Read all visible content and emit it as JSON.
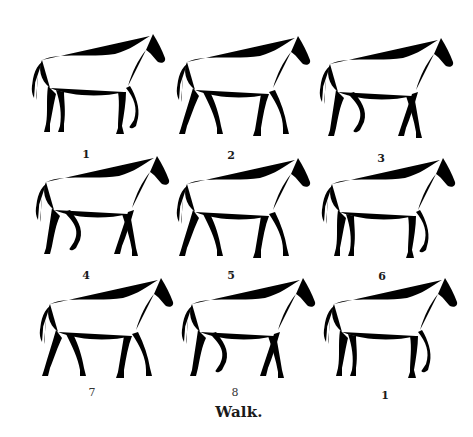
{
  "figure": {
    "caption": "Walk.",
    "panels": [
      {
        "label": "1",
        "row": 1,
        "col": 1
      },
      {
        "label": "2",
        "row": 1,
        "col": 2
      },
      {
        "label": "3",
        "row": 1,
        "col": 3
      },
      {
        "label": "4",
        "row": 2,
        "col": 1
      },
      {
        "label": "5",
        "row": 2,
        "col": 2
      },
      {
        "label": "6",
        "row": 2,
        "col": 3
      },
      {
        "label": "7",
        "row": 3,
        "col": 1
      },
      {
        "label": "8",
        "row": 3,
        "col": 2
      },
      {
        "label": "1",
        "row": 3,
        "col": 3
      }
    ]
  }
}
